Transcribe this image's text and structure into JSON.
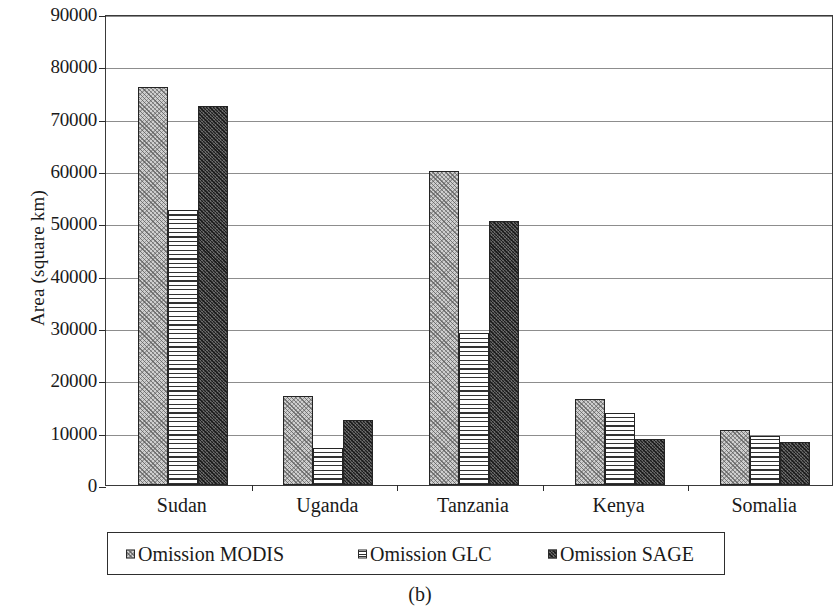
{
  "chart_data": {
    "type": "bar",
    "title": "",
    "xlabel": "",
    "ylabel": "Area (square km)",
    "ylim": [
      0,
      90000
    ],
    "ytick_step": 10000,
    "yticks": [
      "0",
      "10000",
      "20000",
      "30000",
      "40000",
      "50000",
      "60000",
      "70000",
      "80000",
      "90000"
    ],
    "grid": true,
    "legend_position": "below-axes",
    "categories": [
      "Sudan",
      "Uganda",
      "Tanzania",
      "Kenya",
      "Somalia"
    ],
    "series": [
      {
        "name": "Omission MODIS",
        "pattern": "light-diagonal-hatch",
        "values": [
          76000,
          17000,
          60000,
          16500,
          10600
        ]
      },
      {
        "name": "Omission GLC",
        "pattern": "horizontal-lines",
        "values": [
          52500,
          7000,
          29000,
          13800,
          9300
        ]
      },
      {
        "name": "Omission SAGE",
        "pattern": "dark-stipple",
        "values": [
          72500,
          12500,
          50500,
          8700,
          8300
        ]
      }
    ]
  },
  "legend": {
    "entries": [
      {
        "label": "Omission MODIS"
      },
      {
        "label": "Omission GLC"
      },
      {
        "label": "Omission SAGE"
      }
    ]
  },
  "caption": "(b)",
  "colors": {
    "axis": "#2c2c2c",
    "gridline": "#8d8d8d",
    "modis_fill": "#cfcfcf",
    "glc_fill": "#ffffff",
    "sage_fill": "#4a4a4a"
  }
}
